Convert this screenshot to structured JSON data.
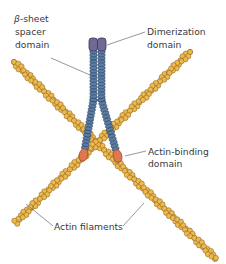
{
  "diagram": {
    "labels": {
      "beta_sheet_line1_symbol": "β",
      "beta_sheet_line1_rest": "-sheet",
      "beta_sheet_line2": "spacer",
      "beta_sheet_line3": "domain",
      "dimerization_line1": "Dimerization",
      "dimerization_line2": "domain",
      "actin_binding_line1": "Actin-binding",
      "actin_binding_line2": "domain",
      "actin_filaments": "Actin filaments"
    },
    "colors": {
      "actin_fill": "#EDB84E",
      "actin_stroke": "#8A6420",
      "spacer_fill": "#5C7EA6",
      "spacer_stroke": "#2C4464",
      "dimer_fill": "#6E6A94",
      "dimer_stroke": "#3A3658",
      "binding_fill": "#E0774E",
      "binding_stroke": "#9A4A2C",
      "leader_line": "#6b6b6b",
      "text": "#3a3a3a"
    },
    "filaments": [
      {
        "name": "filament-a",
        "start": [
          190,
          52
        ],
        "end": [
          14,
          224
        ]
      },
      {
        "name": "filament-b",
        "start": [
          14,
          62
        ],
        "end": [
          216,
          259
        ]
      }
    ]
  }
}
